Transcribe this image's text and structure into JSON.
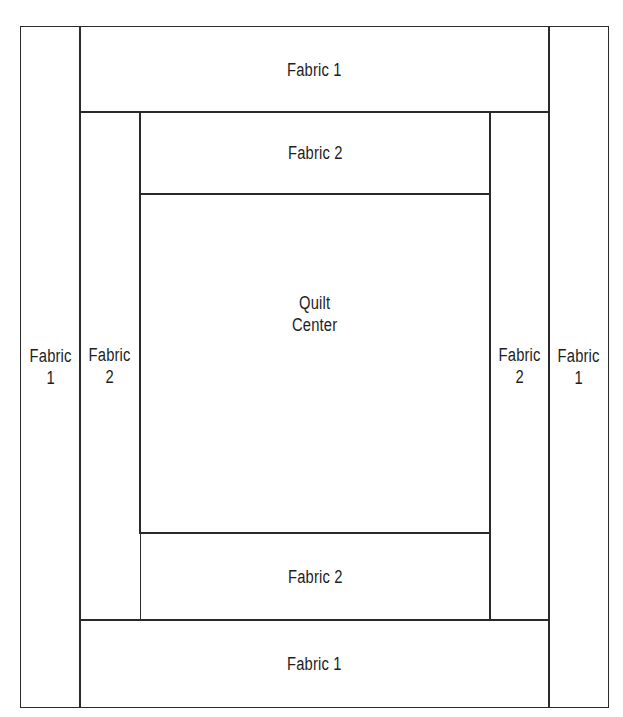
{
  "diagram": {
    "pieces": [
      {
        "id": "fabric1-left",
        "label": "Fabric\n1"
      },
      {
        "id": "fabric1-right",
        "label": "Fabric\n1"
      },
      {
        "id": "fabric1-top",
        "label": "Fabric 1"
      },
      {
        "id": "fabric1-bottom",
        "label": "Fabric 1"
      },
      {
        "id": "fabric2-left",
        "label": "Fabric\n2"
      },
      {
        "id": "fabric2-right",
        "label": "Fabric\n2"
      },
      {
        "id": "fabric2-top",
        "label": "Fabric 2"
      },
      {
        "id": "fabric2-bottom",
        "label": "Fabric 2"
      },
      {
        "id": "quilt-center",
        "label": "Quilt\nCenter"
      }
    ],
    "line_color": "#2a2a2a",
    "background": "#ffffff"
  }
}
